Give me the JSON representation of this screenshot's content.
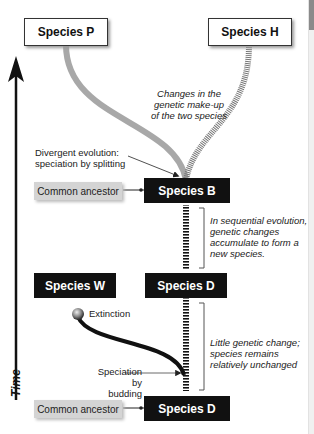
{
  "species": {
    "p": "Species P",
    "h": "Species H",
    "b": "Species B",
    "d_upper": "Species D",
    "w": "Species W",
    "d_lower": "Species D"
  },
  "labels": {
    "common_ancestor_top": "Common ancestor",
    "common_ancestor_bottom": "Common ancestor",
    "divergent": "Divergent evolution:\nspeciation by splitting",
    "extinction": "Extinction",
    "budding": "Speciation\nby budding",
    "time": "Time"
  },
  "notes": {
    "changes": "Changes in the\ngenetic make-up\nof the two species",
    "sequential": "In sequential evolution,\ngenetic changes\naccumulate to form a\nnew species.",
    "little_change": "Little genetic change;\nspecies remains\nrelatively unchanged"
  },
  "colors": {
    "species_p_line": "#a8a8a8",
    "species_h_line": "#888888",
    "box_dark": "#111111",
    "box_grey": "#d4d4d4"
  }
}
